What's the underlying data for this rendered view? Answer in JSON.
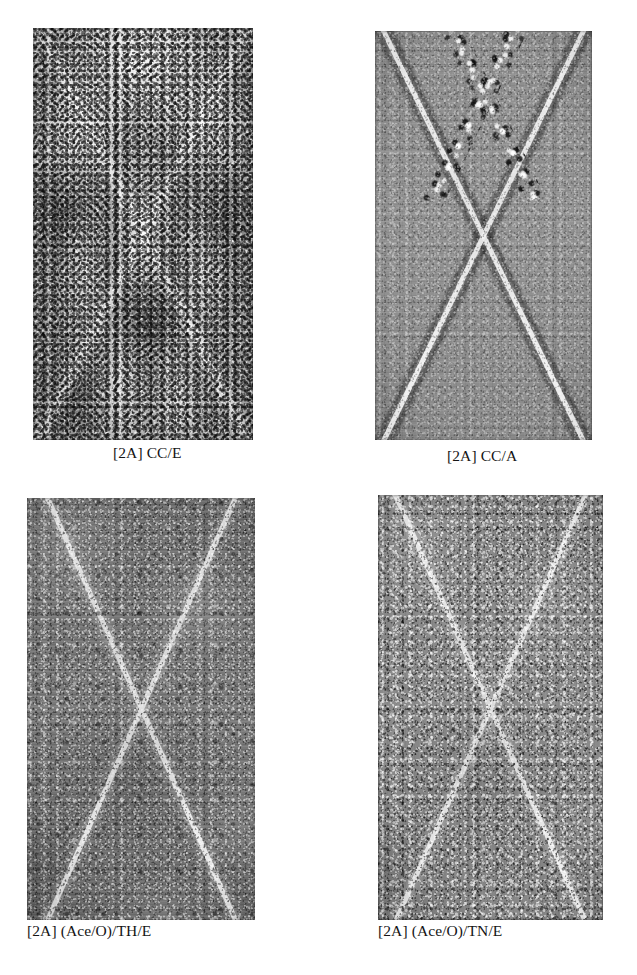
{
  "figure": {
    "layout": "2x2 grid of micrograph panels with captions beneath each",
    "background_color": "#ffffff",
    "caption_color": "#151515",
    "panels": [
      {
        "id": "panel-1",
        "caption": "[2A] CC/E",
        "specimen_code": "CC/E",
        "group": "[2A]",
        "position": "top-left",
        "x": 33,
        "y": 28,
        "width": 220,
        "height": 412,
        "caption_x": 113,
        "caption_y": 444,
        "base_color": "#a8a8a8",
        "appearance": "heavily corroded, bright white blotchy deposits obscuring an X-shaped scribe; dark pitting speckle"
      },
      {
        "id": "panel-2",
        "caption": "[2A] CC/A",
        "specimen_code": "CC/A",
        "group": "[2A]",
        "position": "top-right",
        "x": 375,
        "y": 31,
        "width": 217,
        "height": 409,
        "caption_x": 447,
        "caption_y": 444,
        "base_color": "#8f8f8f",
        "appearance": "medium grey surface with a bright X-shaped scribe flanked by dark corrosion creep along the upper arms"
      },
      {
        "id": "panel-3",
        "caption": "[2A] (Ace/O)/TH/E",
        "specimen_code": "(Ace/O)/TH/E",
        "group": "[2A]",
        "position": "bottom-left",
        "x": 27,
        "y": 498,
        "width": 228,
        "height": 422,
        "caption_x": 27,
        "caption_y": 925,
        "base_color": "#747474",
        "appearance": "dark grey horizontally striated surface with a clean bright X-shaped scribe, minimal creep"
      },
      {
        "id": "panel-4",
        "caption": "[2A] (Ace/O)/TN/E",
        "specimen_code": "(Ace/O)/TN/E",
        "group": "[2A]",
        "position": "bottom-right",
        "x": 378,
        "y": 495,
        "width": 225,
        "height": 425,
        "caption_x": 378,
        "caption_y": 925,
        "base_color": "#878787",
        "appearance": "mid-grey strongly speckled surface with a clean bright X-shaped scribe"
      }
    ]
  }
}
